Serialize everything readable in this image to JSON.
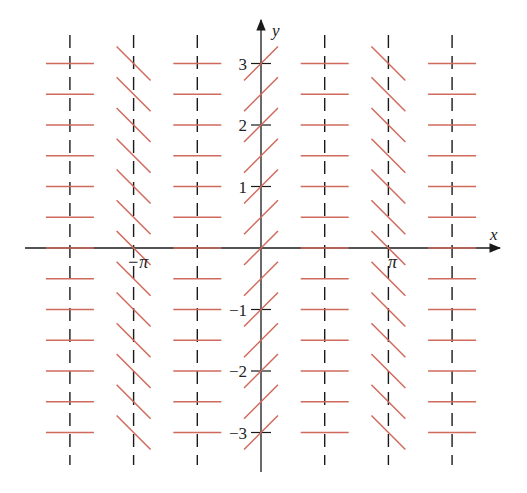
{
  "diagram": {
    "type": "slope-field",
    "colors": {
      "axis": "#1a1a1a",
      "segment": "#d06a5c",
      "dashed_line": "#1a1a1a",
      "label": "#222222"
    },
    "axes": {
      "x_label": "x",
      "y_label": "y",
      "x_tick_labels": [
        {
          "value": -3.14159,
          "label": "−π"
        },
        {
          "value": 3.14159,
          "label": "π"
        }
      ],
      "y_tick_labels": [
        {
          "value": 3,
          "label": "3"
        },
        {
          "value": 2,
          "label": "2"
        },
        {
          "value": 1,
          "label": "1"
        },
        {
          "value": -1,
          "label": "−1"
        },
        {
          "value": -2,
          "label": "−2"
        },
        {
          "value": -3,
          "label": "−3"
        }
      ]
    },
    "columns": [
      {
        "x": -4.712,
        "slope": 0,
        "dashed": true
      },
      {
        "x": -3.14159,
        "slope": -1,
        "dashed": true
      },
      {
        "x": -1.5708,
        "slope": 0,
        "dashed": true
      },
      {
        "x": 0,
        "slope": 1,
        "dashed": false
      },
      {
        "x": 1.5708,
        "slope": 0,
        "dashed": true
      },
      {
        "x": 3.14159,
        "slope": -1,
        "dashed": true
      },
      {
        "x": 4.712,
        "slope": 0,
        "dashed": true
      }
    ],
    "rows_y": [
      3,
      2.5,
      2,
      1.5,
      1,
      0.5,
      0,
      -0.5,
      -1,
      -1.5,
      -2,
      -2.5,
      -3
    ]
  }
}
